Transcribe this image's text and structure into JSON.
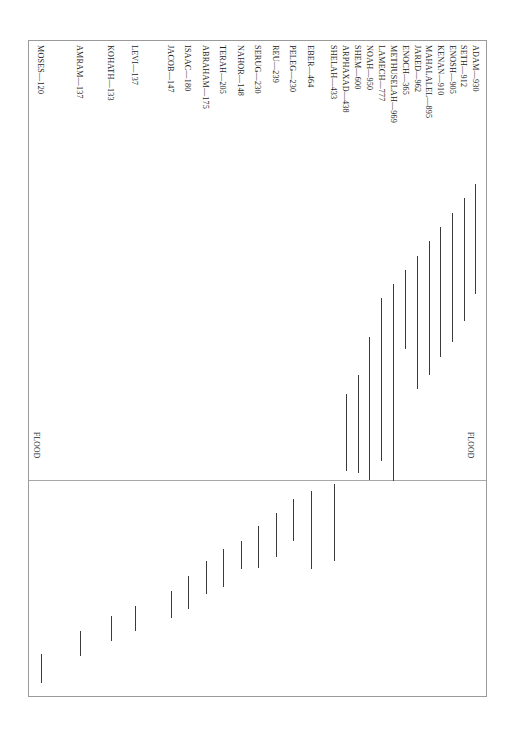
{
  "figure": {
    "type_hint": "rotated-horizontal-bar-chart",
    "frame": {
      "left": 28,
      "top": 40,
      "width": 459,
      "height": 657
    }
  },
  "annotations": {
    "flood_right": {
      "text": "FLOOD",
      "x": 474,
      "y": 432
    },
    "flood_left": {
      "text": "FLOOD",
      "x": 40,
      "y": 432
    },
    "flood_line_y": 479
  },
  "chart_data": {
    "type": "bar",
    "title": "",
    "subtitle": "",
    "xlabel": "",
    "ylabel": "",
    "orientation": "vertical-rotated",
    "grid": false,
    "legend": false,
    "note": "Lifespans of Biblical patriarchs, in years. Each rule spans birth-year to death-year on a shared timeline; the FLOOD reference line marks the Deluge.",
    "categories": [
      "ADAM",
      "SETH",
      "ENOSH",
      "KENAN",
      "MAHALALEL",
      "JARED",
      "ENOCH",
      "METHUSELAH",
      "LAMECH",
      "NOAH",
      "SHEM",
      "ARPHAXAD",
      "SHELAH",
      "EBER",
      "PELEG",
      "REU",
      "SERUG",
      "NAHOR",
      "TERAH",
      "ABRAHAM",
      "ISAAC",
      "JACOB",
      "LEVI",
      "KOHATH",
      "AMRAM",
      "MOSES"
    ],
    "values": [
      930,
      912,
      905,
      910,
      895,
      962,
      365,
      969,
      777,
      950,
      600,
      438,
      433,
      464,
      239,
      239,
      230,
      148,
      205,
      175,
      180,
      147,
      137,
      133,
      137,
      120
    ],
    "labels": [
      "ADAM—930",
      "SETH—912",
      "ENOSH—905",
      "KENAN—910",
      "MAHALALEL—895",
      "JARED—962",
      "ENOCH—365",
      "METHUSELAH—969",
      "LAMECH—777",
      "NOAH—950",
      "SHEM—600",
      "ARPHAXAD—438",
      "SHELAH—433",
      "EBER—464",
      "PELEG—230",
      "REU—239",
      "SERUG—230",
      "NAHOR—148",
      "TERAH—205",
      "ABRAHAM—175",
      "ISAAC—180",
      "JACOB—147",
      "LEVI—137",
      "KOHATH—133",
      "AMRAM—137",
      "MOSES—120"
    ],
    "bars": [
      {
        "name": "ADAM",
        "label": "ADAM—930",
        "value": 930,
        "x": 474,
        "y0": 183,
        "y1": 293
      },
      {
        "name": "SETH",
        "label": "SETH—912",
        "value": 912,
        "x": 463,
        "y0": 197,
        "y1": 320
      },
      {
        "name": "ENOSH",
        "label": "ENOSH—905",
        "value": 905,
        "x": 451,
        "y0": 212,
        "y1": 341
      },
      {
        "name": "KENAN",
        "label": "KENAN—910",
        "value": 910,
        "x": 439,
        "y0": 226,
        "y1": 356
      },
      {
        "name": "MAHALALEL",
        "label": "MAHALALEL—895",
        "value": 895,
        "x": 428,
        "y0": 240,
        "y1": 374
      },
      {
        "name": "JARED",
        "label": "JARED—962",
        "value": 962,
        "x": 416,
        "y0": 255,
        "y1": 388
      },
      {
        "name": "ENOCH",
        "label": "ENOCH—365",
        "value": 365,
        "x": 404,
        "y0": 269,
        "y1": 348
      },
      {
        "name": "METHUSELAH",
        "label": "METHUSELAH—969",
        "value": 969,
        "x": 392,
        "y0": 283,
        "y1": 480
      },
      {
        "name": "LAMECH",
        "label": "LAMECH—777",
        "value": 777,
        "x": 380,
        "y0": 297,
        "y1": 460
      },
      {
        "name": "NOAH",
        "label": "NOAH—950",
        "value": 950,
        "x": 368,
        "y0": 336,
        "y1": 479
      },
      {
        "name": "SHEM",
        "label": "SHEM—600",
        "value": 600,
        "x": 357,
        "y0": 374,
        "y1": 472
      },
      {
        "name": "ARPHAXAD",
        "label": "ARPHAXAD—438",
        "value": 438,
        "x": 345,
        "y0": 393,
        "y1": 470
      },
      {
        "name": "SHELAH",
        "label": "SHELAH—433",
        "value": 433,
        "x": 333,
        "y0": 483,
        "y1": 560
      },
      {
        "name": "EBER",
        "label": "EBER—464",
        "value": 464,
        "x": 310,
        "y0": 490,
        "y1": 568
      },
      {
        "name": "PELEG",
        "label": "PELEG—230",
        "value": 230,
        "x": 292,
        "y0": 498,
        "y1": 540
      },
      {
        "name": "REU",
        "label": "REU—239",
        "value": 239,
        "x": 275,
        "y0": 512,
        "y1": 556
      },
      {
        "name": "SERUG",
        "label": "SERUG—230",
        "value": 230,
        "x": 257,
        "y0": 525,
        "y1": 567
      },
      {
        "name": "NAHOR",
        "label": "NAHOR—148",
        "value": 148,
        "x": 240,
        "y0": 540,
        "y1": 568
      },
      {
        "name": "TERAH",
        "label": "TERAH—205",
        "value": 205,
        "x": 222,
        "y0": 548,
        "y1": 586
      },
      {
        "name": "ABRAHAM",
        "label": "ABRAHAM—175",
        "value": 175,
        "x": 205,
        "y0": 560,
        "y1": 593
      },
      {
        "name": "ISAAC",
        "label": "ISAAC—180",
        "value": 180,
        "x": 187,
        "y0": 575,
        "y1": 608
      },
      {
        "name": "JACOB",
        "label": "JACOB—147",
        "value": 147,
        "x": 170,
        "y0": 590,
        "y1": 617
      },
      {
        "name": "LEVI",
        "label": "LEVI—137",
        "value": 137,
        "x": 134,
        "y0": 605,
        "y1": 630
      },
      {
        "name": "KOHATH",
        "label": "KOHATH—133",
        "value": 133,
        "x": 110,
        "y0": 615,
        "y1": 640
      },
      {
        "name": "AMRAM",
        "label": "AMRAM—137",
        "value": 137,
        "x": 79,
        "y0": 630,
        "y1": 655
      },
      {
        "name": "MOSES",
        "label": "MOSES—120",
        "value": 120,
        "x": 40,
        "y0": 653,
        "y1": 682
      }
    ],
    "label_positions": [
      {
        "label": "ADAM—930",
        "x": 479,
        "y": 45
      },
      {
        "label": "SETH—912",
        "x": 467,
        "y": 45
      },
      {
        "label": "ENOSH—905",
        "x": 456,
        "y": 45
      },
      {
        "label": "KENAN—910",
        "x": 444,
        "y": 45
      },
      {
        "label": "MAHALALEL—895",
        "x": 432,
        "y": 45
      },
      {
        "label": "JARED—962",
        "x": 421,
        "y": 45
      },
      {
        "label": "ENOCH—365",
        "x": 409,
        "y": 45
      },
      {
        "label": "METHUSELAH—969",
        "x": 397,
        "y": 45
      },
      {
        "label": "LAMECH—777",
        "x": 385,
        "y": 45
      },
      {
        "label": "NOAH—950",
        "x": 373,
        "y": 45
      },
      {
        "label": "SHEM—600",
        "x": 361,
        "y": 45
      },
      {
        "label": "ARPHAXAD—438",
        "x": 349,
        "y": 45
      },
      {
        "label": "SHELAH—433",
        "x": 337,
        "y": 45
      },
      {
        "label": "EBER—464",
        "x": 314,
        "y": 45
      },
      {
        "label": "PELEG—230",
        "x": 296,
        "y": 45
      },
      {
        "label": "REU—239",
        "x": 279,
        "y": 45
      },
      {
        "label": "SERUG—230",
        "x": 261,
        "y": 45
      },
      {
        "label": "NAHOR—148",
        "x": 244,
        "y": 45
      },
      {
        "label": "TERAH—205",
        "x": 226,
        "y": 45
      },
      {
        "label": "ABRAHAM—175",
        "x": 209,
        "y": 45
      },
      {
        "label": "ISAAC—180",
        "x": 191,
        "y": 45
      },
      {
        "label": "JACOB—147",
        "x": 174,
        "y": 45
      },
      {
        "label": "LEVI—137",
        "x": 138,
        "y": 45
      },
      {
        "label": "KOHATH—133",
        "x": 114,
        "y": 45
      },
      {
        "label": "AMRAM—137",
        "x": 83,
        "y": 45
      },
      {
        "label": "MOSES—120",
        "x": 44,
        "y": 45
      }
    ]
  }
}
